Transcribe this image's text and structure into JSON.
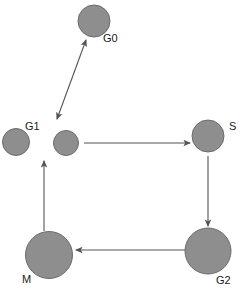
{
  "diagram": {
    "type": "node-link-graph",
    "canvas": {
      "width": 246,
      "height": 289,
      "background": "#ffffff"
    },
    "style": {
      "node_fill": "#8e8e8e",
      "node_stroke": "#6b6b6b",
      "edge_color": "#555555",
      "label_color": "#1a1a1a"
    },
    "nodes": [
      {
        "id": "G0",
        "label": "G0",
        "cx": 94,
        "cy": 21,
        "r": 16,
        "label_x": 103,
        "label_y": 42
      },
      {
        "id": "G1",
        "label": "G1",
        "cx": 16,
        "cy": 142,
        "r": 13.5,
        "label_x": 25,
        "label_y": 130
      },
      {
        "id": "MID",
        "label": "",
        "cx": 66,
        "cy": 143,
        "r": 12.5,
        "label_x": 0,
        "label_y": 0
      },
      {
        "id": "S",
        "label": "S",
        "cx": 208,
        "cy": 136,
        "r": 16,
        "label_x": 229,
        "label_y": 130
      },
      {
        "id": "M",
        "label": "M",
        "cx": 49,
        "cy": 255,
        "r": 23.5,
        "label_x": 22,
        "label_y": 283
      },
      {
        "id": "G2",
        "label": "G2",
        "cx": 208,
        "cy": 251,
        "r": 23,
        "label_x": 216,
        "label_y": 284
      }
    ],
    "edges": [
      {
        "id": "edge-mid-g0",
        "from": "MID",
        "to": "G0",
        "arrow": "double",
        "x1": 57,
        "y1": 119,
        "x2": 86,
        "y2": 40
      },
      {
        "id": "edge-mid-s",
        "from": "MID",
        "to": "S",
        "arrow": "single",
        "x1": 84,
        "y1": 143,
        "x2": 190,
        "y2": 143
      },
      {
        "id": "edge-s-g2",
        "from": "S",
        "to": "G2",
        "arrow": "single",
        "x1": 208,
        "y1": 156,
        "x2": 208,
        "y2": 226
      },
      {
        "id": "edge-g2-m",
        "from": "G2",
        "to": "M",
        "arrow": "single",
        "x1": 185,
        "y1": 250,
        "x2": 76,
        "y2": 250
      },
      {
        "id": "edge-m-mid",
        "from": "M",
        "to": "MID",
        "arrow": "single",
        "x1": 44,
        "y1": 231,
        "x2": 44,
        "y2": 161
      }
    ]
  }
}
